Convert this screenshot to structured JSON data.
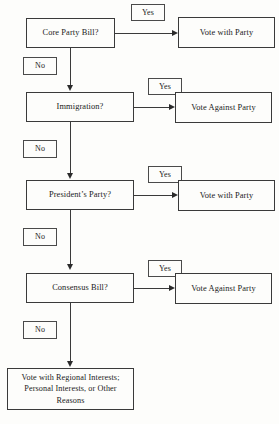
{
  "diagram": {
    "type": "flowchart",
    "background_color": "#fdfdfb",
    "line_color": "#3a3a3a",
    "text_color": "#1a1a1a"
  },
  "labels": {
    "yes": "Yes",
    "no": "No"
  },
  "steps": [
    {
      "id": "core-party-bill",
      "question": "Core Party Bill?",
      "yes_label": "Yes",
      "yes_outcome": "Vote with Party",
      "no_label": "No"
    },
    {
      "id": "immigration",
      "question": "Immigration?",
      "yes_label": "Yes",
      "yes_outcome": "Vote Against Party",
      "no_label": "No"
    },
    {
      "id": "presidents-party",
      "question": "President’s Party?",
      "yes_label": "Yes",
      "yes_outcome": "Vote with Party",
      "no_label": "No"
    },
    {
      "id": "consensus-bill",
      "question": "Consensus Bill?",
      "yes_label": "Yes",
      "yes_outcome": "Vote Against Party",
      "no_label": "No"
    }
  ],
  "final_outcome": {
    "id": "default-outcome",
    "line1": "Vote with Regional Interests;",
    "line2": "Personal Interests, or Other",
    "line3": "Reasons",
    "text": "Vote with Regional Interests; Personal Interests, or Other Reasons"
  }
}
